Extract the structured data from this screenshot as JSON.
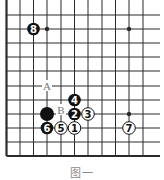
{
  "diagram": {
    "type": "go-board-partial",
    "caption": "图一",
    "grid": {
      "columns_x": [
        6.5,
        20,
        33.5,
        47,
        61,
        74.5,
        88,
        102,
        115.5,
        129,
        143
      ],
      "rows_y": [
        15,
        29,
        43,
        57,
        71,
        86,
        100,
        114,
        128,
        142,
        156
      ],
      "left_edge_thick": true,
      "bottom_edge_thick": true,
      "line_extent_right": 160,
      "line_extent_top": 0
    },
    "star_points": [
      {
        "col": 3,
        "row": 1
      },
      {
        "col": 9,
        "row": 1
      },
      {
        "col": 9,
        "row": 7
      }
    ],
    "stones": [
      {
        "color": "black",
        "label": "8",
        "col": 2,
        "row": 1
      },
      {
        "color": "black",
        "label": "",
        "col": 3,
        "row": 7
      },
      {
        "color": "black",
        "label": "2",
        "col": 5,
        "row": 7
      },
      {
        "color": "white",
        "label": "3",
        "col": 6,
        "row": 7
      },
      {
        "color": "black",
        "label": "4",
        "col": 5,
        "row": 6
      },
      {
        "color": "black",
        "label": "6",
        "col": 3,
        "row": 8
      },
      {
        "color": "white",
        "label": "5",
        "col": 4,
        "row": 8
      },
      {
        "color": "white",
        "label": "1",
        "col": 5,
        "row": 8
      },
      {
        "color": "white",
        "label": "7",
        "col": 9,
        "row": 8
      }
    ],
    "markers": [
      {
        "label": "A",
        "col": 3,
        "row": 5
      },
      {
        "label": "B",
        "col": 4,
        "row": 7
      }
    ],
    "colors": {
      "line": "#2a2a2a",
      "black_stone": "#111111",
      "white_stone": "#ffffff",
      "marker_text": "#777777"
    }
  }
}
